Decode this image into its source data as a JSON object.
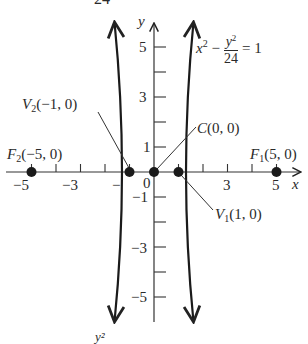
{
  "figure": {
    "type": "hyperbola-graph",
    "equation": {
      "lhs_x_term": "x",
      "lhs_x_exp": "2",
      "minus": "−",
      "frac_num_var": "y",
      "frac_num_exp": "2",
      "frac_den": "24",
      "equals": "= 1"
    },
    "top_cropped_text": "24",
    "bottom_cropped_text": "y²",
    "axes": {
      "x_label": "x",
      "y_label": "y",
      "x_ticks": [
        "−5",
        "−3",
        "−",
        "0",
        "3",
        "5"
      ],
      "y_ticks": [
        "5",
        "3",
        "1",
        "−1",
        "−3",
        "−5"
      ]
    },
    "points": [
      {
        "id": "F2",
        "letter": "F",
        "sub": "2",
        "coords": "(−5, 0)"
      },
      {
        "id": "V2",
        "letter": "V",
        "sub": "2",
        "coords": "(−1, 0)"
      },
      {
        "id": "C",
        "letter": "C",
        "sub": "",
        "coords": "(0, 0)"
      },
      {
        "id": "V1",
        "letter": "V",
        "sub": "1",
        "coords": "(1, 0)"
      },
      {
        "id": "F1",
        "letter": "F",
        "sub": "1",
        "coords": "(5, 0)"
      }
    ]
  }
}
